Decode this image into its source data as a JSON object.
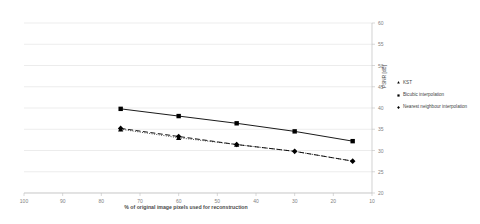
{
  "chart_data": {
    "type": "line",
    "title": "",
    "xlabel": "% of original image pixels used for reconstruction",
    "ylabel": "PSNR [dB]",
    "xlim": [
      100,
      10
    ],
    "ylim": [
      20,
      60
    ],
    "x_ticks": [
      100,
      90,
      80,
      70,
      60,
      50,
      40,
      30,
      20,
      10
    ],
    "y_ticks": [
      20,
      25,
      30,
      35,
      40,
      45,
      50,
      55,
      60
    ],
    "x_axis_reversed": true,
    "y_axis_position": "right",
    "grid": "horizontal",
    "legend_position": "right",
    "x": [
      75,
      60,
      45,
      30,
      15
    ],
    "series": [
      {
        "name": "KST",
        "marker": "triangle",
        "line_style": "dotted",
        "color": "#000000",
        "x": [
          75,
          60
        ],
        "values": [
          35,
          33
        ]
      },
      {
        "name": "Bicubic interpolation",
        "marker": "square",
        "line_style": "solid",
        "color": "#000000",
        "x": [
          75,
          60,
          45,
          30,
          15
        ],
        "values": [
          39.8,
          38.1,
          36.4,
          34.5,
          32.2
        ]
      },
      {
        "name": "Nearest neighbour interpolation",
        "marker": "diamond",
        "line_style": "dashed",
        "color": "#000000",
        "x": [
          75,
          60,
          45,
          30,
          15
        ],
        "values": [
          35.2,
          33.3,
          31.4,
          29.8,
          27.5
        ]
      }
    ]
  },
  "legend": {
    "items": [
      {
        "label": "KST",
        "marker": "triangle"
      },
      {
        "label": "Bicubic interpolation",
        "marker": "square"
      },
      {
        "label": "Nearest neighbour interpolation",
        "marker": "diamond"
      }
    ]
  },
  "axis": {
    "y_title": "PSNR [dB]",
    "x_title": "% of original image pixels used for reconstruction"
  }
}
